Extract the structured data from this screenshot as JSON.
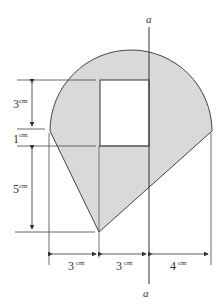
{
  "figure": {
    "axis_label_top": "a",
    "axis_label_bottom": "a",
    "unit": "cm",
    "dims": {
      "left_top": {
        "value": "3",
        "unit": "cm"
      },
      "left_mid": {
        "value": "1",
        "unit": "cm"
      },
      "left_bottom": {
        "value": "5",
        "unit": "cm"
      },
      "bottom_left": {
        "value": "3",
        "unit": "cm"
      },
      "bottom_mid": {
        "value": "3",
        "unit": "cm"
      },
      "bottom_right": {
        "value": "4",
        "unit": "cm"
      }
    },
    "colors": {
      "fill": "#d9d9d9",
      "stroke": "#444444",
      "hole": "#ffffff"
    }
  }
}
